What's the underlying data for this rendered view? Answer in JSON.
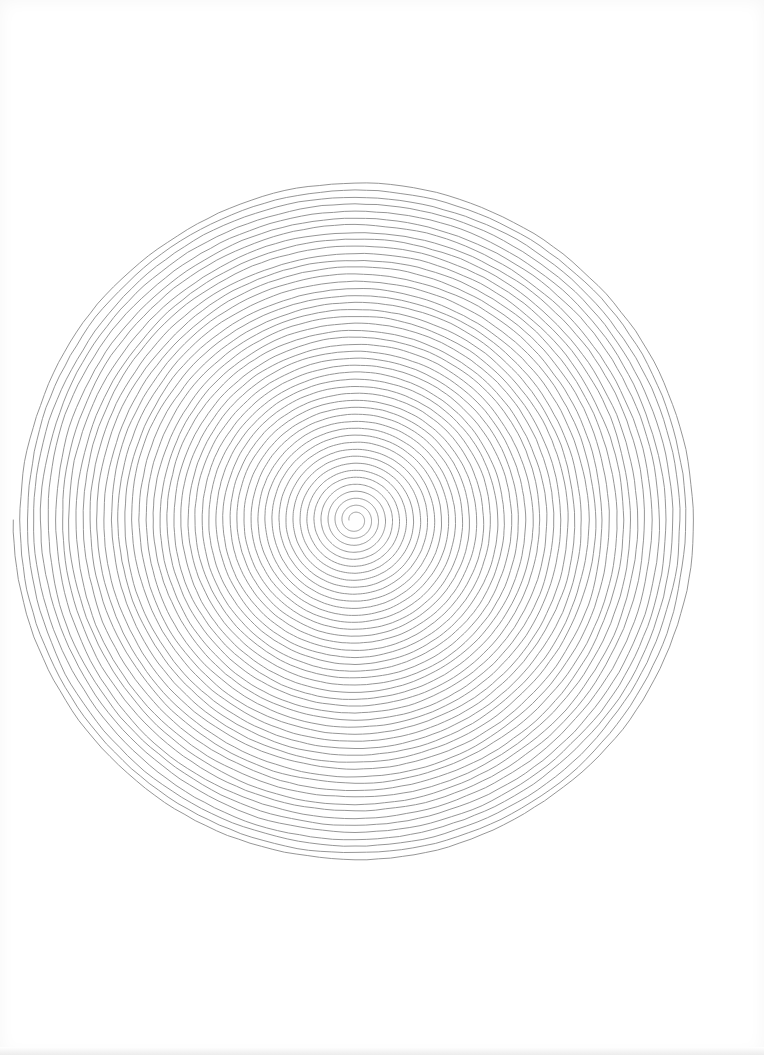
{
  "artwork": {
    "title": "Spiral line drawing",
    "description": "Hand-drawn Archimedean spiral of thin gray pen lines on white paper",
    "center": {
      "x": 355,
      "y": 520
    },
    "outer_radius": 342,
    "inner_radius": 6,
    "turns": 48,
    "line_color": "#8a8a8a",
    "line_width": 0.9,
    "paper_color": "#ffffff"
  }
}
